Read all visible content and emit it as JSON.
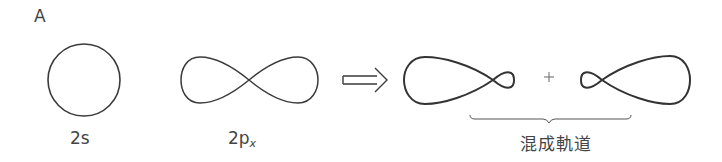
{
  "panel_label": "A",
  "orbitals": {
    "s": {
      "label": "2s",
      "shape": "circle"
    },
    "p": {
      "label_main": "2p",
      "label_sub": "x",
      "shape": "figure-eight"
    }
  },
  "arrow": {
    "type": "double-line-right-arrow"
  },
  "hybrid": {
    "plus": "+",
    "label": "混成軌道",
    "orbital_1": {
      "shape": "large-lobe-left-small-lobe-right"
    },
    "orbital_2": {
      "shape": "small-lobe-left-large-lobe-right"
    }
  },
  "colors": {
    "stroke": "#3a3a3a",
    "text": "#444444",
    "background": "#ffffff"
  }
}
